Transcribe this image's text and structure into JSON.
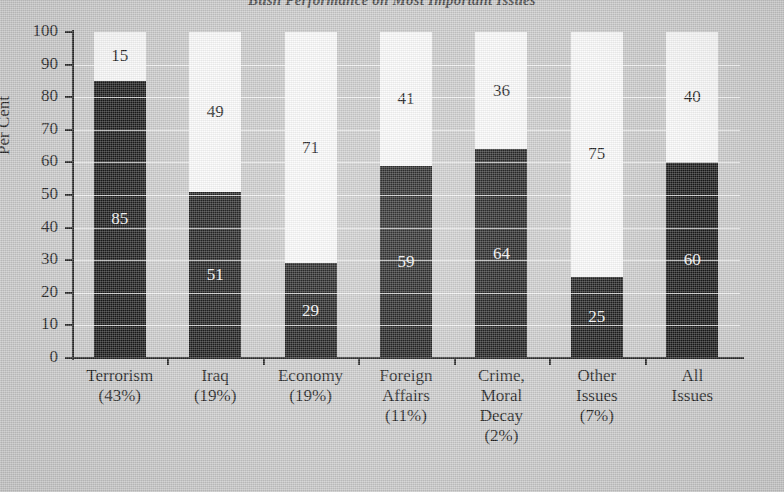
{
  "chart_data": {
    "type": "bar",
    "subtype": "stacked-bar",
    "title": "Bush Performance on Most Important Issues",
    "xlabel": "",
    "ylabel": "Per Cent",
    "ylim": [
      0,
      100
    ],
    "ytick_labels": [
      "100",
      "90",
      "80",
      "70",
      "60",
      "50",
      "40",
      "30",
      "20",
      "10",
      "0"
    ],
    "ytick_values": [
      100,
      90,
      80,
      70,
      60,
      50,
      40,
      30,
      20,
      10,
      0
    ],
    "grid": true,
    "legend": "none",
    "categories": [
      {
        "name": "Terrorism",
        "share": "(43%)",
        "lines": [
          "Terrorism",
          "(43%)"
        ]
      },
      {
        "name": "Iraq",
        "share": "(19%)",
        "lines": [
          "Iraq",
          "(19%)"
        ]
      },
      {
        "name": "Economy",
        "share": "(19%)",
        "lines": [
          "Economy",
          "(19%)"
        ]
      },
      {
        "name": "Foreign Affairs",
        "share": "(11%)",
        "lines": [
          "Foreign",
          "Affairs",
          "(11%)"
        ]
      },
      {
        "name": "Crime, Moral Decay",
        "share": "(2%)",
        "lines": [
          "Crime,",
          "Moral",
          "Decay",
          "(2%)"
        ]
      },
      {
        "name": "Other Issues",
        "share": "(7%)",
        "lines": [
          "Other",
          "Issues",
          "(7%)"
        ]
      },
      {
        "name": "All Issues",
        "share": "",
        "lines": [
          "All",
          "Issues"
        ]
      }
    ],
    "series": [
      {
        "name": "lower-black",
        "color": "#1a1a1a",
        "values": [
          85,
          51,
          29,
          59,
          64,
          25,
          60
        ]
      },
      {
        "name": "upper-white",
        "color": "#fbfbfb",
        "values": [
          15,
          49,
          71,
          41,
          36,
          75,
          40
        ]
      }
    ],
    "labels_black": [
      "85",
      "51",
      "29",
      "59",
      "64",
      "25",
      "60"
    ],
    "labels_white": [
      "15",
      "49",
      "71",
      "41",
      "36",
      "75",
      "40"
    ],
    "colors": {
      "background": "#cccccc",
      "axis": "#262626",
      "grid": "#ffffff",
      "bar_lower": "#1a1a1a",
      "bar_upper": "#fbfbfb",
      "text": "#1f1f1f"
    }
  }
}
